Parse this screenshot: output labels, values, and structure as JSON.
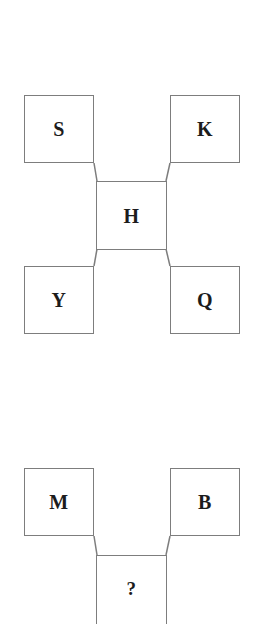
{
  "page": {
    "width": 260,
    "height": 618,
    "background_color": "#ffffff",
    "box_border_color": "#7d7d7d",
    "box_fill_color": "#ffffff",
    "connector_color": "#7d7d7d",
    "letter_color": "#1c1c1c"
  },
  "diagrams": [
    {
      "id": "top-diagram",
      "name": "complete-analogy-figure",
      "layout": "x-cross",
      "center": {
        "label": "H",
        "x": 96,
        "y": 181,
        "w": 71,
        "h": 69
      },
      "corners": [
        {
          "position": "top-left",
          "label": "S",
          "x": 24,
          "y": 95,
          "w": 70,
          "h": 68
        },
        {
          "position": "top-right",
          "label": "K",
          "x": 170,
          "y": 95,
          "w": 70,
          "h": 68
        },
        {
          "position": "bottom-left",
          "label": "Y",
          "x": 24,
          "y": 266,
          "w": 70,
          "h": 68
        },
        {
          "position": "bottom-right",
          "label": "Q",
          "x": 170,
          "y": 266,
          "w": 70,
          "h": 68
        }
      ],
      "connectors": [
        {
          "from": "S",
          "to": "H",
          "x1": 94,
          "y1": 163,
          "x2": 97,
          "y2": 181
        },
        {
          "from": "K",
          "to": "H",
          "x1": 170,
          "y1": 163,
          "x2": 166,
          "y2": 181
        },
        {
          "from": "Y",
          "to": "H",
          "x1": 94,
          "y1": 266,
          "x2": 97,
          "y2": 249
        },
        {
          "from": "Q",
          "to": "H",
          "x1": 170,
          "y1": 266,
          "x2": 166,
          "y2": 249
        }
      ]
    },
    {
      "id": "bottom-diagram",
      "name": "incomplete-analogy-figure",
      "layout": "v-converge",
      "clipped_at_bottom": true,
      "center": {
        "label": "?",
        "x": 96,
        "y": 555,
        "w": 71,
        "h": 63
      },
      "corners": [
        {
          "position": "top-left",
          "label": "M",
          "x": 24,
          "y": 468,
          "w": 70,
          "h": 68
        },
        {
          "position": "top-right",
          "label": "B",
          "x": 170,
          "y": 468,
          "w": 70,
          "h": 68
        }
      ],
      "connectors": [
        {
          "from": "M",
          "to": "?",
          "x1": 94,
          "y1": 536,
          "x2": 97,
          "y2": 555
        },
        {
          "from": "B",
          "to": "?",
          "x1": 170,
          "y1": 536,
          "x2": 166,
          "y2": 555
        }
      ]
    }
  ]
}
